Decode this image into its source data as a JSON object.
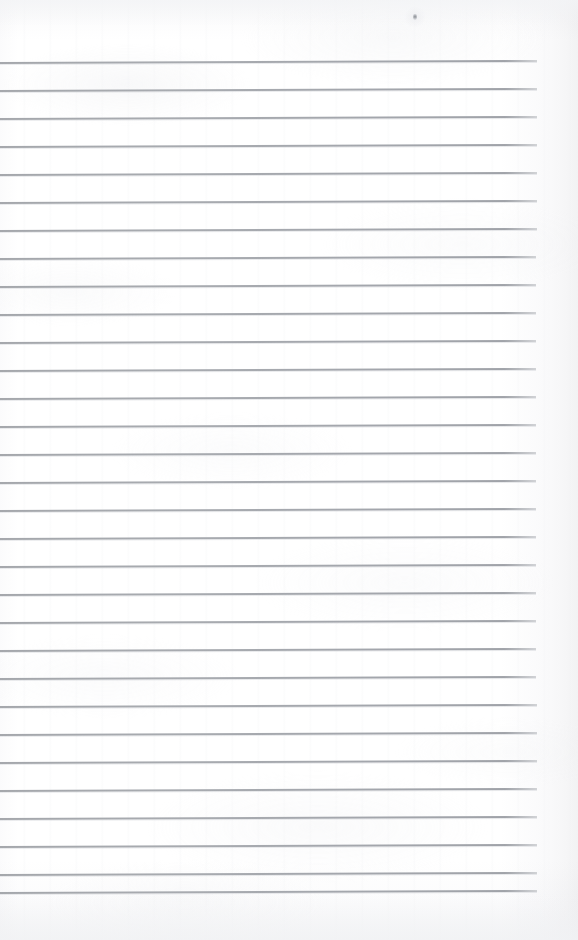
{
  "document": {
    "kind": "scanned-blank-ruled-page",
    "title": "",
    "visible_text": "",
    "page_width": 578,
    "page_height": 940,
    "background_color": "#fdfdfd",
    "rule_color": "#a8abb0"
  },
  "ruling": {
    "line_count": 31,
    "first_line_y": 62,
    "spacing": 28,
    "line_start_x": 0,
    "line_end_x": 537,
    "line_thickness": 2,
    "tilt_degrees": -0.22,
    "top_margin": 62,
    "bottom_margin": 48,
    "right_margin": 41,
    "lines_y": [
      62,
      90,
      118,
      146,
      174,
      202,
      230,
      258,
      286,
      314,
      342,
      370,
      398,
      426,
      454,
      482,
      510,
      538,
      566,
      594,
      622,
      650,
      678,
      706,
      734,
      762,
      790,
      818,
      846,
      874,
      892
    ],
    "lines_end_x": [
      537,
      537,
      537,
      537,
      537,
      537,
      537,
      536,
      536,
      536,
      536,
      536,
      536,
      536,
      536,
      536,
      536,
      536,
      536,
      536,
      536,
      536,
      536,
      537,
      537,
      537,
      537,
      537,
      537,
      537,
      537
    ]
  },
  "artifacts": {
    "speck": {
      "label": "dust-speck",
      "x": 413,
      "y": 14,
      "color": "#7a7e85"
    }
  }
}
